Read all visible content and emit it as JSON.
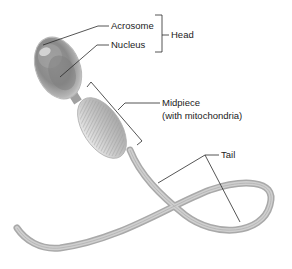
{
  "diagram": {
    "labels": {
      "acrosome": "Acrosome",
      "nucleus": "Nucleus",
      "head": "Head",
      "midpiece_line1": "Midpiece",
      "midpiece_line2": "(with mitochondria)",
      "tail": "Tail"
    },
    "colors": {
      "leader_line": "#2a2a2a",
      "cell_fill": "#c9c9c9",
      "cell_dark": "#8e8e8e",
      "label_text": "#222222"
    }
  }
}
